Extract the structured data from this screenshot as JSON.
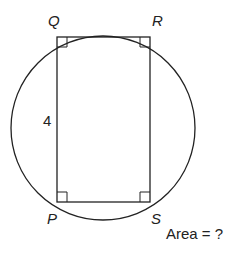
{
  "figure": {
    "shape": "rectangle inscribed in circle",
    "vertices": {
      "top_left": "Q",
      "top_right": "R",
      "bottom_left": "P",
      "bottom_right": "S"
    },
    "side_label": "4",
    "question": "Area = ?",
    "right_angle_markers": 4,
    "stroke_color": "#222222"
  }
}
